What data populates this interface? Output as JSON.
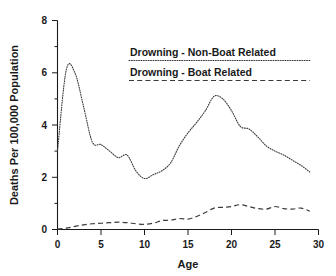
{
  "chart_data": {
    "type": "line",
    "title": "",
    "xlabel": "Age",
    "ylabel": "Deaths Per 100,000 Population",
    "xlim": [
      0,
      30
    ],
    "ylim": [
      0,
      8
    ],
    "xticks": [
      0,
      5,
      10,
      15,
      20,
      25,
      30
    ],
    "yticks": [
      0,
      2,
      4,
      6,
      8
    ],
    "xtick_labels": [
      "0",
      "5",
      "10",
      "15",
      "20",
      "25",
      "30"
    ],
    "ytick_labels": [
      "0",
      "2",
      "4",
      "6",
      "8"
    ],
    "minor_tick_step_x": 1,
    "minor_tick_step_y": 1,
    "grid": false,
    "legend_position": "upper-center",
    "x": [
      0,
      1,
      2,
      3,
      4,
      5,
      6,
      7,
      8,
      9,
      10,
      11,
      12,
      13,
      14,
      15,
      16,
      17,
      18,
      19,
      20,
      21,
      22,
      23,
      24,
      25,
      26,
      27,
      28,
      29
    ],
    "series": [
      {
        "name": "Drowning - Non-Boat Related",
        "style": "dotted",
        "color": "#3a3a3a",
        "values": [
          3.0,
          6.1,
          6.0,
          4.7,
          3.35,
          3.25,
          3.0,
          2.75,
          2.85,
          2.25,
          1.95,
          2.1,
          2.25,
          2.55,
          3.2,
          3.7,
          4.1,
          4.55,
          5.1,
          5.0,
          4.55,
          3.95,
          3.85,
          3.55,
          3.2,
          3.0,
          2.85,
          2.65,
          2.45,
          2.2
        ]
      },
      {
        "name": "Drowning - Boat Related",
        "style": "dashed",
        "color": "#3a3a3a",
        "values": [
          0.02,
          0.05,
          0.12,
          0.18,
          0.22,
          0.24,
          0.26,
          0.28,
          0.26,
          0.22,
          0.2,
          0.24,
          0.34,
          0.36,
          0.42,
          0.4,
          0.5,
          0.65,
          0.82,
          0.85,
          0.88,
          0.95,
          0.88,
          0.8,
          0.78,
          0.88,
          0.8,
          0.78,
          0.82,
          0.7
        ]
      }
    ]
  },
  "legend": {
    "items": [
      {
        "label": "Drowning - Non-Boat Related",
        "style": "dotted"
      },
      {
        "label": "Drowning - Boat Related",
        "style": "dashed"
      }
    ]
  },
  "axes": {
    "x_title": "Age",
    "y_title": "Deaths Per 100,000 Population"
  }
}
